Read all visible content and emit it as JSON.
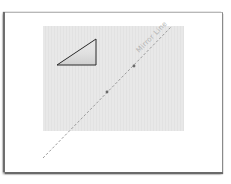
{
  "diagram": {
    "mirror_line": {
      "label": "Mirror Line",
      "style": "dashed",
      "color": "#9a9a9a",
      "start": [
        43,
        158
      ],
      "end": [
        171,
        27
      ]
    },
    "grid_panel": {
      "color": "#e6e6e6",
      "x": 43,
      "y": 26,
      "width": 141,
      "height": 105
    },
    "shape": {
      "type": "right-triangle",
      "vertices": [
        [
          57,
          65
        ],
        [
          96,
          65
        ],
        [
          96,
          39
        ]
      ],
      "stroke": "#2a2a2a",
      "fill": "#d4d4d4"
    },
    "points": [
      {
        "name": "point-a",
        "x": 134,
        "y": 66,
        "color": "#6a6a6a"
      },
      {
        "name": "point-b",
        "x": 107,
        "y": 92,
        "color": "#6a6a6a"
      }
    ]
  }
}
